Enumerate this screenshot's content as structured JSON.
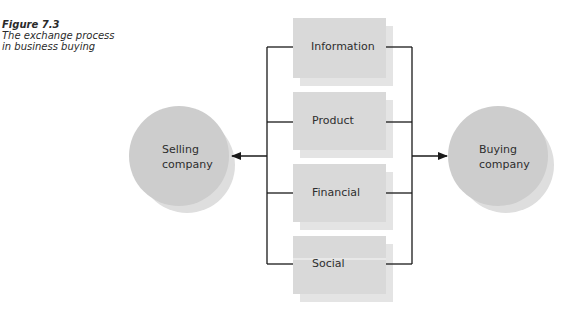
{
  "figure": {
    "number": "Figure 7.3",
    "title_line1": "The exchange process",
    "title_line2": "in business buying"
  },
  "nodes": {
    "selling": {
      "line1": "Selling",
      "line2": "company"
    },
    "buying": {
      "line1": "Buying",
      "line2": "company"
    }
  },
  "exchanges": [
    {
      "label": "Information"
    },
    {
      "label": "Product"
    },
    {
      "label": "Financial"
    },
    {
      "label": "Social"
    }
  ],
  "colors": {
    "box_fill": "#d9d9d9",
    "box_shadow": "#e4e4e4",
    "circle_fill": "#cdcdcd",
    "circle_shadow": "#dedede",
    "line": "#1a1a1a",
    "text": "#2e2e2e"
  }
}
